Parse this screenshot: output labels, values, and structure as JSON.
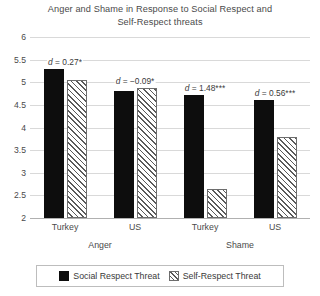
{
  "chart_data": {
    "type": "bar",
    "title": "Anger and Shame in Response to Social Respect and Self-Respect threats",
    "title_line1": "Anger and Shame in Response to Social Respect and",
    "title_line2": "Self-Respect threats",
    "xlabel": "",
    "ylabel": "",
    "ylim": [
      2,
      6
    ],
    "ytick_labels": [
      "6",
      "5.5",
      "5",
      "4.5",
      "4",
      "3.5",
      "3",
      "2.5",
      "2"
    ],
    "ytick_values": [
      6,
      5.5,
      5,
      4.5,
      4,
      3.5,
      3,
      2.5,
      2
    ],
    "grid": true,
    "legend_position": "bottom",
    "categories": [
      "Turkey",
      "US",
      "Turkey",
      "US"
    ],
    "groups": [
      {
        "label": "Anger",
        "categories": [
          "Turkey",
          "US"
        ]
      },
      {
        "label": "Shame",
        "categories": [
          "Turkey",
          "US"
        ]
      }
    ],
    "series": [
      {
        "name": "Social Respect Threat",
        "style": "solid",
        "color": "#0d0d0d",
        "values": [
          5.3,
          4.8,
          4.72,
          4.6
        ]
      },
      {
        "name": "Self-Respect Threat",
        "style": "hatched",
        "color": "#ffffff",
        "values": [
          5.05,
          4.88,
          2.65,
          3.8
        ]
      }
    ],
    "annotations": [
      {
        "text_prefix": "d",
        "text_rest": " = 0.27*",
        "at_category": 0,
        "value": 5.3
      },
      {
        "text_prefix": "d",
        "text_rest": " = −0.09*",
        "at_category": 1,
        "value": 4.88
      },
      {
        "text_prefix": "d",
        "text_rest": " = 1.48***",
        "at_category": 2,
        "value": 4.72
      },
      {
        "text_prefix": "d",
        "text_rest": " = 0.56***",
        "at_category": 3,
        "value": 4.6
      }
    ]
  },
  "legend": {
    "items": [
      {
        "label": "Social Respect Threat",
        "style": "solid"
      },
      {
        "label": "Self-Respect Threat",
        "style": "hatched"
      }
    ]
  }
}
